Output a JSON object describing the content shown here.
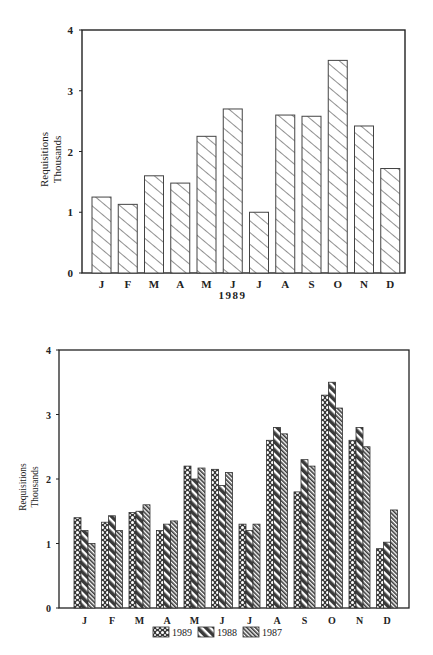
{
  "chart_data": [
    {
      "type": "bar",
      "title": "",
      "xlabel": "1989",
      "ylabel": "Requisitions Thousands",
      "ylabel_lines": [
        "Requisitions",
        "Thousands"
      ],
      "ylim": [
        0,
        4
      ],
      "yticks": [
        0,
        1,
        2,
        3,
        4
      ],
      "grid": false,
      "legend": null,
      "categories": [
        "J",
        "F",
        "M",
        "A",
        "M",
        "J",
        "J",
        "A",
        "S",
        "O",
        "N",
        "D"
      ],
      "values": [
        1.25,
        1.13,
        1.6,
        1.48,
        2.25,
        2.7,
        1.0,
        2.6,
        2.58,
        3.5,
        2.42,
        1.72
      ],
      "pattern": "diagonal-hatch"
    },
    {
      "type": "bar",
      "title": "",
      "xlabel": "",
      "ylabel": "Requisitions Thousands",
      "ylabel_lines": [
        "Requisitions",
        "Thousands"
      ],
      "ylim": [
        0,
        4
      ],
      "yticks": [
        0,
        1,
        2,
        3,
        4
      ],
      "grid": false,
      "legend_position": "bottom",
      "categories": [
        "J",
        "F",
        "M",
        "A",
        "M",
        "J",
        "J",
        "A",
        "S",
        "O",
        "N",
        "D"
      ],
      "series": [
        {
          "name": "1989",
          "pattern": "checker",
          "values": [
            1.4,
            1.33,
            1.48,
            1.2,
            2.2,
            2.15,
            1.3,
            2.6,
            1.8,
            3.3,
            2.6,
            0.92
          ]
        },
        {
          "name": "1988",
          "pattern": "wide-diagonal",
          "values": [
            1.2,
            1.43,
            1.5,
            1.3,
            2.0,
            1.9,
            1.2,
            2.8,
            2.3,
            3.5,
            2.8,
            1.02
          ]
        },
        {
          "name": "1987",
          "pattern": "fine-diagonal",
          "values": [
            1.0,
            1.2,
            1.6,
            1.35,
            2.17,
            2.1,
            1.3,
            2.7,
            2.2,
            3.1,
            2.5,
            1.52
          ]
        }
      ]
    }
  ]
}
